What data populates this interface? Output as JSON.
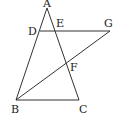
{
  "diagram": {
    "type": "geometry",
    "points": {
      "A": {
        "label": "A",
        "x": 47,
        "y": 8
      },
      "B": {
        "label": "B",
        "x": 16,
        "y": 100
      },
      "C": {
        "label": "C",
        "x": 79,
        "y": 100
      },
      "D": {
        "label": "D",
        "x": 40,
        "y": 31
      },
      "E": {
        "label": "E",
        "x": 55,
        "y": 31
      },
      "F": {
        "label": "F",
        "x": 66,
        "y": 62
      },
      "G": {
        "label": "G",
        "x": 110,
        "y": 31
      }
    },
    "segments": [
      [
        "A",
        "B"
      ],
      [
        "A",
        "C"
      ],
      [
        "B",
        "C"
      ],
      [
        "D",
        "G"
      ],
      [
        "B",
        "G"
      ]
    ],
    "labels": {
      "A": "A",
      "B": "B",
      "C": "C",
      "D": "D",
      "E": "E",
      "F": "F",
      "G": "G"
    }
  }
}
